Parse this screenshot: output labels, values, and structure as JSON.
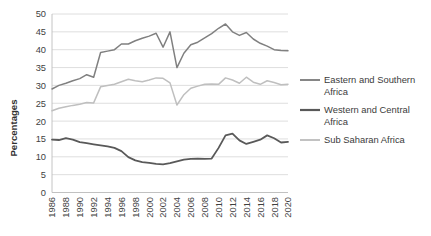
{
  "chart_data": {
    "type": "line",
    "title": "",
    "xlabel": "",
    "ylabel": "Percentages",
    "ylim": [
      0,
      50
    ],
    "ytick_step": 5,
    "yticks": [
      0,
      5,
      10,
      15,
      20,
      25,
      30,
      35,
      40,
      45,
      50
    ],
    "xlim": [
      1986,
      2020
    ],
    "xticks": [
      1986,
      1988,
      1990,
      1992,
      1994,
      1996,
      1998,
      2000,
      2002,
      2004,
      2006,
      2008,
      2010,
      2012,
      2014,
      2016,
      2018,
      2020
    ],
    "x": [
      1986,
      1987,
      1988,
      1989,
      1990,
      1991,
      1992,
      1993,
      1994,
      1995,
      1996,
      1997,
      1998,
      1999,
      2000,
      2001,
      2002,
      2003,
      2004,
      2005,
      2006,
      2007,
      2008,
      2009,
      2010,
      2011,
      2012,
      2013,
      2014,
      2015,
      2016,
      2017,
      2018,
      2019,
      2020
    ],
    "grid": true,
    "legend_position": "right",
    "series": [
      {
        "name": "Eastern and Southern Africa",
        "color": "#808080",
        "width": 1.5,
        "values": [
          29.0,
          30.0,
          30.6,
          31.3,
          31.9,
          33.0,
          32.3,
          39.2,
          39.6,
          40.0,
          41.6,
          41.6,
          42.5,
          43.2,
          43.8,
          44.6,
          40.7,
          45.0,
          35.0,
          39.0,
          41.4,
          42.1,
          43.3,
          44.5,
          46.0,
          47.2,
          45.0,
          44.0,
          44.8,
          43.0,
          41.8,
          41.0,
          40.0,
          39.8,
          39.7
        ]
      },
      {
        "name": "Western and Central Africa",
        "color": "#595959",
        "width": 1.8,
        "values": [
          14.8,
          14.7,
          15.2,
          14.8,
          14.1,
          13.8,
          13.5,
          13.2,
          12.9,
          12.5,
          11.6,
          9.9,
          9.0,
          8.5,
          8.3,
          8.0,
          7.9,
          8.2,
          8.7,
          9.2,
          9.4,
          9.5,
          9.4,
          9.5,
          12.5,
          16.0,
          16.5,
          14.6,
          13.6,
          14.2,
          14.8,
          16.0,
          15.2,
          14.0,
          14.2
        ]
      },
      {
        "name": "Sub Saharan Africa",
        "color": "#bfbfbf",
        "width": 1.5,
        "values": [
          22.9,
          23.6,
          24.0,
          24.4,
          24.7,
          25.2,
          25.1,
          29.6,
          30.0,
          30.3,
          31.0,
          31.7,
          31.3,
          31.0,
          31.5,
          32.1,
          32.0,
          30.7,
          24.5,
          27.4,
          29.2,
          29.8,
          30.3,
          30.4,
          30.3,
          32.1,
          31.5,
          30.6,
          32.3,
          30.9,
          30.3,
          31.3,
          30.8,
          30.2,
          30.3
        ]
      }
    ]
  },
  "legend": {
    "items": [
      {
        "label_line1": "Eastern and Southern",
        "label_line2": "Africa"
      },
      {
        "label_line1": "Western and Central",
        "label_line2": "Africa"
      },
      {
        "label_line1": "Sub Saharan Africa",
        "label_line2": ""
      }
    ]
  },
  "axes": {
    "y_title": "Percentages"
  }
}
